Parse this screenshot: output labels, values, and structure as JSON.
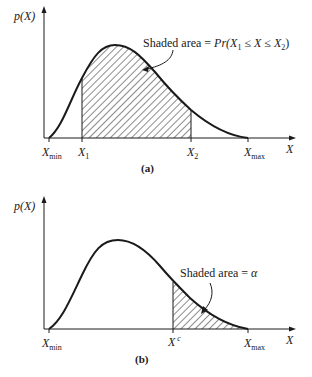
{
  "panel_a": {
    "y_axis_label": "p(X)",
    "x_axis_label": "X",
    "tick_labels": {
      "xmin": {
        "main": "X",
        "sub": "min"
      },
      "x1": {
        "main": "X",
        "sub": "1"
      },
      "x2": {
        "main": "X",
        "sub": "2"
      },
      "xmax": {
        "main": "X",
        "sub": "max"
      }
    },
    "annotation": {
      "prefix": "Shaded area = ",
      "expr_pr": "Pr",
      "expr_open": "(X",
      "expr_sub1": "1",
      "expr_mid": " ≤ X ≤ X",
      "expr_sub2": "2",
      "expr_close": ")"
    },
    "caption": "(a)"
  },
  "panel_b": {
    "y_axis_label": "p(X)",
    "x_axis_label": "X",
    "tick_labels": {
      "xmin": {
        "main": "X",
        "sub": "min"
      },
      "xc": {
        "main": "X",
        "sup": "c"
      },
      "xmax": {
        "main": "X",
        "sub": "max"
      }
    },
    "annotation": {
      "prefix": "Shaded area = ",
      "symbol": "α"
    },
    "caption": "(b)"
  },
  "colors": {
    "ink": "#1a1a1a",
    "background": "#ffffff"
  }
}
